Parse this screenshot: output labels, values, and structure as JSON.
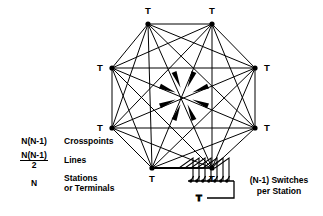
{
  "figure": {
    "node_label": "T",
    "node_count": 8,
    "line_color": "#000000"
  },
  "nodes": [
    {
      "id": "n0",
      "label": "T",
      "x": 148,
      "y": 24,
      "label_x": 148,
      "label_y": 14
    },
    {
      "id": "n1",
      "label": "T",
      "x": 212,
      "y": 24,
      "label_x": 212,
      "label_y": 14
    },
    {
      "id": "n2",
      "label": "T",
      "x": 255,
      "y": 68,
      "label_x": 267,
      "label_y": 71
    },
    {
      "id": "n3",
      "label": "T",
      "x": 255,
      "y": 128,
      "label_x": 267,
      "label_y": 131
    },
    {
      "id": "n4",
      "label": "T",
      "x": 212,
      "y": 168,
      "label_x": 212,
      "label_y": 182
    },
    {
      "id": "n5",
      "label": "T",
      "x": 152,
      "y": 168,
      "label_x": 152,
      "label_y": 182
    },
    {
      "id": "n6",
      "label": "T",
      "x": 112,
      "y": 128,
      "label_x": 100,
      "label_y": 131
    },
    {
      "id": "n7",
      "label": "T",
      "x": 112,
      "y": 68,
      "label_x": 100,
      "label_y": 71
    }
  ],
  "arrows": {
    "count": 8,
    "direction": "inward-to-center",
    "center_x": 184,
    "center_y": 96
  },
  "legend": {
    "rows": [
      {
        "symbol_type": "plain",
        "symbol": "N(N-1)",
        "description": "Crosspoints"
      },
      {
        "symbol_type": "fraction",
        "numerator": "N(N-1)",
        "denominator": "2",
        "description": "Lines"
      },
      {
        "symbol_type": "plain",
        "symbol": "N",
        "description": "Stations",
        "description_line2": "or Terminals"
      }
    ]
  },
  "switch_detail": {
    "caption_line1": "(N-1) Switches",
    "caption_line2": "per Station",
    "station_label": "T",
    "switch_count": 7,
    "bus_y": 181,
    "bus_x_start": 190,
    "bus_x_end": 232
  }
}
